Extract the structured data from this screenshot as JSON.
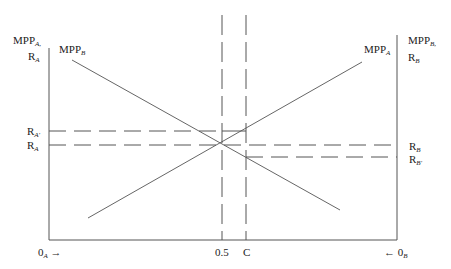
{
  "diagram": {
    "title": "",
    "left_axis_label": {
      "line1": "MPP",
      "line1_sub": "A,",
      "line2": "R",
      "line2_sub": "A"
    },
    "right_axis_label": {
      "line1": "MPP",
      "line1_sub": "B,",
      "line2": "R",
      "line2_sub": "B"
    },
    "curves": [
      {
        "name": "MPP",
        "sub": "B",
        "direction": "downward"
      },
      {
        "name": "MPP",
        "sub": "A",
        "direction": "upward"
      }
    ],
    "left_levels": [
      {
        "label": "R",
        "sub": "A'",
        "description": "higher return for A"
      },
      {
        "label": "R",
        "sub": "A",
        "description": "equilibrium return for A"
      }
    ],
    "right_levels": [
      {
        "label": "R",
        "sub": "B",
        "description": "equilibrium return for B"
      },
      {
        "label": "R",
        "sub": "B'",
        "description": "lower return for B"
      }
    ],
    "x_ticks": [
      {
        "label": "0.5"
      },
      {
        "label": "C"
      }
    ],
    "origin_left": {
      "label": "0",
      "sub": "A",
      "arrow": "→"
    },
    "origin_right": {
      "label": "0",
      "sub": "B",
      "arrow": "←"
    },
    "colors": {
      "line": "#555555",
      "text": "#222222",
      "background": "#ffffff"
    }
  }
}
